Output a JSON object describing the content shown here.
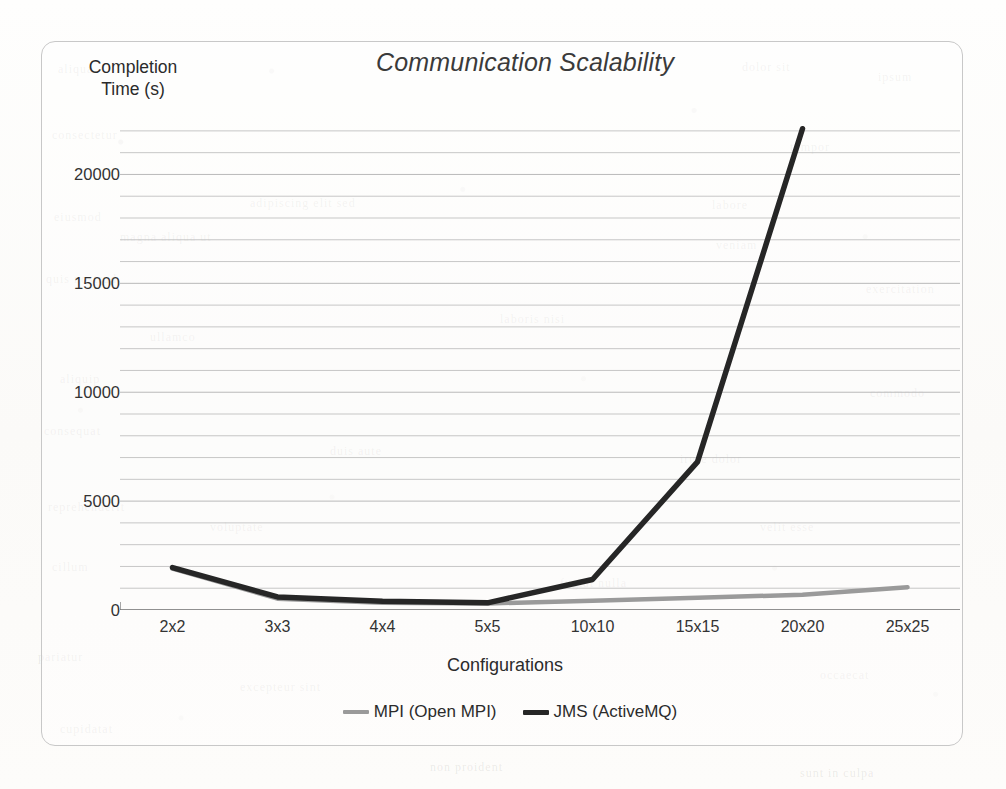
{
  "chart_data": {
    "type": "line",
    "title": "Communication Scalability",
    "xlabel": "Configurations",
    "ylabel": "Completion Time (s)",
    "ylabel_line1": "Completion",
    "ylabel_line2": "Time (s)",
    "categories": [
      "2x2",
      "3x3",
      "4x4",
      "5x5",
      "10x10",
      "15x15",
      "20x20",
      "25x25"
    ],
    "ylim": [
      0,
      22500
    ],
    "ytick_labels": [
      "0",
      "5000",
      "10000",
      "15000",
      "20000"
    ],
    "ytick_values": [
      0,
      5000,
      10000,
      15000,
      20000
    ],
    "minor_gridline_step": 1000,
    "grid": true,
    "legend_position": "bottom",
    "series": [
      {
        "name": "MPI (Open MPI)",
        "color": "#9a9a9a",
        "values": [
          1900,
          520,
          330,
          300,
          430,
          560,
          700,
          1050
        ]
      },
      {
        "name": "JMS (ActiveMQ)",
        "color": "#262626",
        "values": [
          1950,
          600,
          400,
          330,
          1400,
          6800,
          22100,
          null
        ]
      }
    ]
  },
  "ghost_marks": [
    {
      "text": "aliqua",
      "x": 58,
      "y": 62
    },
    {
      "text": "dolor sit",
      "x": 742,
      "y": 60
    },
    {
      "text": "ipsum",
      "x": 878,
      "y": 70
    },
    {
      "text": "consectetur",
      "x": 52,
      "y": 128
    },
    {
      "text": "tempor",
      "x": 790,
      "y": 140
    },
    {
      "text": "adipiscing elit sed",
      "x": 250,
      "y": 196
    },
    {
      "text": "labore",
      "x": 712,
      "y": 198
    },
    {
      "text": "eiusmod",
      "x": 54,
      "y": 210
    },
    {
      "text": "magna aliqua ut",
      "x": 120,
      "y": 230
    },
    {
      "text": "veniam",
      "x": 716,
      "y": 238
    },
    {
      "text": "quis nostrud",
      "x": 46,
      "y": 272
    },
    {
      "text": "exercitation",
      "x": 866,
      "y": 282
    },
    {
      "text": "ullamco",
      "x": 150,
      "y": 330
    },
    {
      "text": "laboris nisi",
      "x": 500,
      "y": 312
    },
    {
      "text": "aliquip",
      "x": 60,
      "y": 372
    },
    {
      "text": "commodo",
      "x": 870,
      "y": 386
    },
    {
      "text": "consequat",
      "x": 44,
      "y": 424
    },
    {
      "text": "duis aute",
      "x": 330,
      "y": 444
    },
    {
      "text": "irure dolor",
      "x": 680,
      "y": 452
    },
    {
      "text": "reprehenderit",
      "x": 48,
      "y": 500
    },
    {
      "text": "voluptate",
      "x": 210,
      "y": 520
    },
    {
      "text": "velit esse",
      "x": 760,
      "y": 520
    },
    {
      "text": "cillum",
      "x": 52,
      "y": 560
    },
    {
      "text": "fugiat nulla",
      "x": 560,
      "y": 576
    },
    {
      "text": "pariatur",
      "x": 38,
      "y": 650
    },
    {
      "text": "excepteur sint",
      "x": 240,
      "y": 680
    },
    {
      "text": "occaecat",
      "x": 820,
      "y": 668
    },
    {
      "text": "cupidatat",
      "x": 60,
      "y": 722
    },
    {
      "text": "non proident",
      "x": 430,
      "y": 760
    },
    {
      "text": "sunt in culpa",
      "x": 800,
      "y": 766
    }
  ]
}
